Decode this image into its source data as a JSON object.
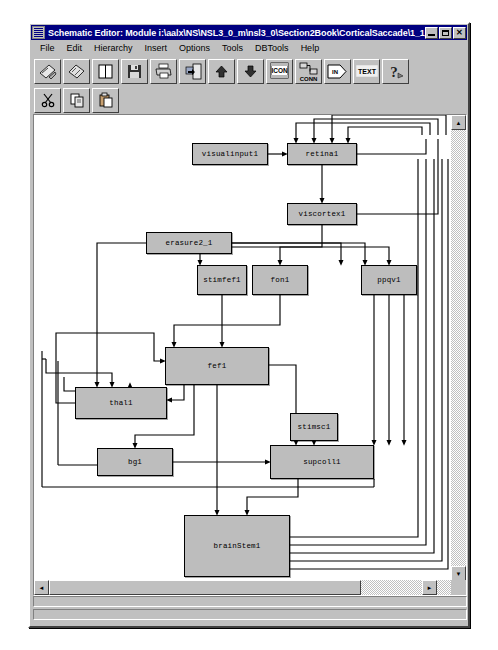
{
  "window": {
    "title": "Schematic Editor: Module i:\\aalx\\NS\\NSL3_0_m\\nsl3_0\\Section2Book\\CorticalSaccade\\1_1_1Corti...",
    "icon": "schematic-window-icon",
    "buttons": {
      "minimize": "_",
      "maximize": "□",
      "close": "✕"
    }
  },
  "menubar": {
    "items": [
      {
        "label": "File"
      },
      {
        "label": "Edit"
      },
      {
        "label": "Hierarchy"
      },
      {
        "label": "Insert"
      },
      {
        "label": "Options"
      },
      {
        "label": "Tools"
      },
      {
        "label": "DBTools"
      },
      {
        "label": "Help"
      }
    ]
  },
  "toolbar_main": {
    "buttons": [
      {
        "name": "new-schematic-icon",
        "label": ""
      },
      {
        "name": "open-module-icon",
        "label": ""
      },
      {
        "name": "page-icon",
        "label": ""
      },
      {
        "name": "save-icon",
        "label": ""
      },
      {
        "name": "print-icon",
        "label": ""
      },
      {
        "name": "export-icon",
        "label": ""
      },
      {
        "name": "level-up-icon",
        "label": ""
      },
      {
        "name": "level-down-icon",
        "label": ""
      },
      {
        "name": "icon-tool-icon",
        "label": "ICON"
      },
      {
        "name": "connection-tool-icon",
        "label": "CONN"
      },
      {
        "name": "input-port-tool-icon",
        "label": "IN"
      },
      {
        "name": "text-tool-icon",
        "label": "TEXT"
      },
      {
        "name": "help-tool-icon",
        "label": "?"
      }
    ]
  },
  "toolbar_edit": {
    "buttons": [
      {
        "name": "cut-icon",
        "label": ""
      },
      {
        "name": "copy-icon",
        "label": ""
      },
      {
        "name": "paste-icon",
        "label": ""
      }
    ]
  },
  "statusbar": {
    "line1": "",
    "line2": ""
  },
  "scrollbars": {
    "horizontal": {
      "left_arrow": "◄",
      "right_arrow": "►"
    },
    "vertical": {
      "up_arrow": "▲",
      "down_arrow": "▼"
    }
  },
  "schematic": {
    "colors": {
      "node_fill": "#bdbdbd",
      "node_border": "#000000",
      "wire": "#000000",
      "canvas": "#ffffff"
    },
    "nodes": [
      {
        "id": "visualinput1",
        "label": "visualinput1",
        "x": 158,
        "y": 28,
        "w": 76,
        "h": 22
      },
      {
        "id": "retina1",
        "label": "retina1",
        "x": 253,
        "y": 28,
        "w": 70,
        "h": 22
      },
      {
        "id": "viscortex1",
        "label": "viscortex1",
        "x": 253,
        "y": 88,
        "w": 70,
        "h": 22
      },
      {
        "id": "erasure2_1",
        "label": "erasure2_1",
        "x": 112,
        "y": 117,
        "w": 86,
        "h": 22
      },
      {
        "id": "stimfef1",
        "label": "stimfef1",
        "x": 163,
        "y": 150,
        "w": 50,
        "h": 30
      },
      {
        "id": "fon1",
        "label": "fon1",
        "x": 218,
        "y": 150,
        "w": 56,
        "h": 30
      },
      {
        "id": "ppqv1",
        "label": "ppqv1",
        "x": 327,
        "y": 150,
        "w": 56,
        "h": 30
      },
      {
        "id": "fef1",
        "label": "fef1",
        "x": 131,
        "y": 232,
        "w": 104,
        "h": 38
      },
      {
        "id": "thal1",
        "label": "thal1",
        "x": 41,
        "y": 272,
        "w": 92,
        "h": 32
      },
      {
        "id": "stimsc1",
        "label": "stimsc1",
        "x": 256,
        "y": 298,
        "w": 48,
        "h": 28
      },
      {
        "id": "bg1",
        "label": "bg1",
        "x": 63,
        "y": 333,
        "w": 76,
        "h": 28
      },
      {
        "id": "supcoll1",
        "label": "supcoll1",
        "x": 236,
        "y": 330,
        "w": 104,
        "h": 34
      },
      {
        "id": "brainStem1",
        "label": "brainStem1",
        "x": 150,
        "y": 400,
        "w": 106,
        "h": 62
      }
    ]
  }
}
